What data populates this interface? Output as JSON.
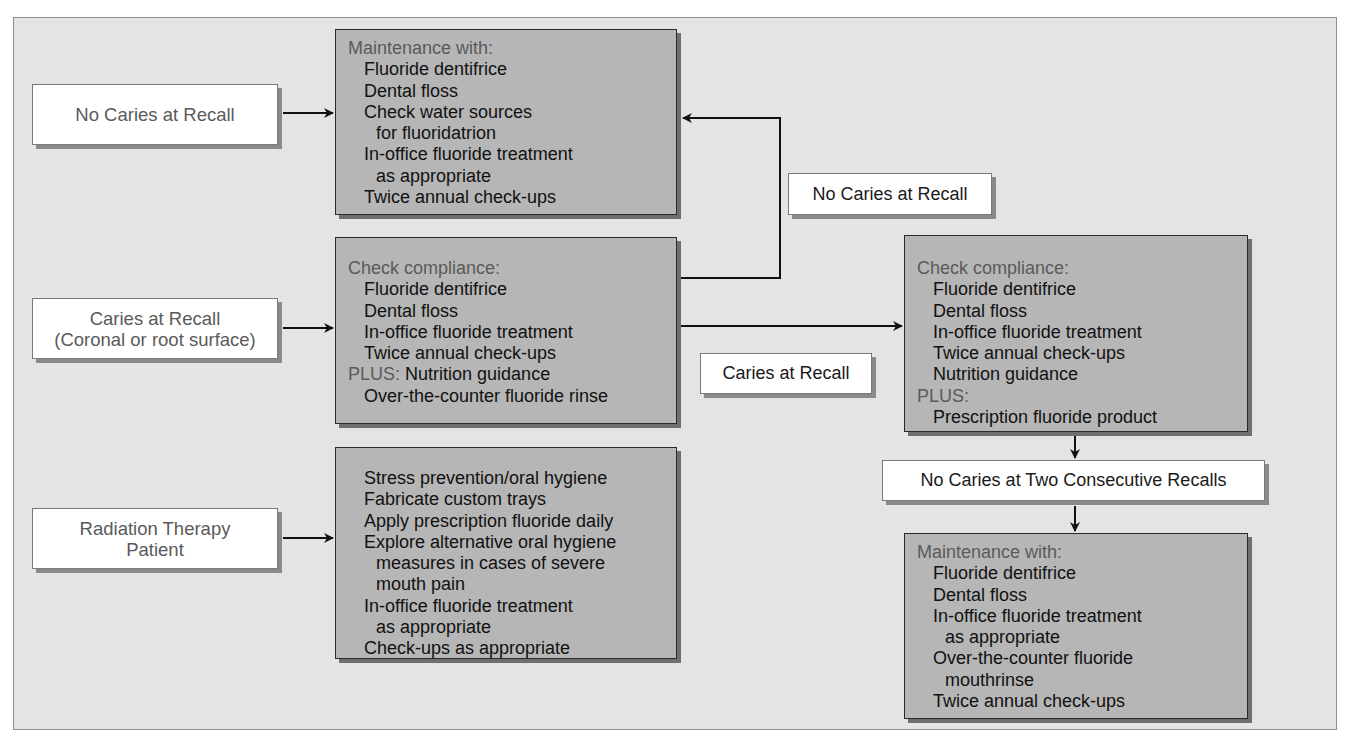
{
  "diagram": {
    "conditions": {
      "no_caries": "No Caries at Recall",
      "caries_line1": "Caries at Recall",
      "caries_line2": "(Coronal or root surface)",
      "radiation_line1": "Radiation Therapy",
      "radiation_line2": "Patient"
    },
    "transitions": {
      "no_caries_feedback": "No Caries at Recall",
      "caries_escalate": "Caries at Recall",
      "two_consecutive": "No Caries at Two Consecutive Recalls"
    },
    "maintenance_box": {
      "header": "Maintenance with:",
      "items": [
        "Fluoride dentifrice",
        "Dental floss",
        "Check water sources",
        "for fluoridatrion",
        "In-office fluoride treatment",
        "as appropriate",
        "Twice annual check-ups"
      ]
    },
    "compliance_box": {
      "header": "Check compliance:",
      "items": [
        "Fluoride dentifrice",
        "Dental floss",
        "In-office fluoride treatment",
        "Twice annual check-ups"
      ],
      "plus_label": "PLUS:",
      "plus_items": [
        "Nutrition guidance",
        "Over-the-counter fluoride rinse"
      ]
    },
    "radiation_box": {
      "items": [
        "Stress prevention/oral hygiene",
        "Fabricate custom trays",
        "Apply prescription fluoride daily",
        "Explore alternative oral hygiene",
        "measures in cases of severe",
        "mouth pain",
        "In-office fluoride treatment",
        "as appropriate",
        "Check-ups as appropriate"
      ]
    },
    "escalated_box": {
      "header": "Check compliance:",
      "items": [
        "Fluoride dentifrice",
        "Dental floss",
        "In-office fluoride treatment",
        "Twice annual check-ups",
        "Nutrition guidance"
      ],
      "plus_label": "PLUS:",
      "plus_items": [
        "Prescription fluoride product"
      ]
    },
    "final_maintenance_box": {
      "header": "Maintenance with:",
      "items": [
        "Fluoride dentifrice",
        "Dental floss",
        "In-office fluoride treatment",
        "as appropriate",
        "Over-the-counter fluoride",
        "mouthrinse",
        "Twice annual check-ups"
      ]
    },
    "colors": {
      "background": "#e4e4e4",
      "action_box": "#b6b6b6",
      "label_box": "#ffffff",
      "header_text": "#5a5a5a",
      "item_text": "#111111"
    }
  }
}
